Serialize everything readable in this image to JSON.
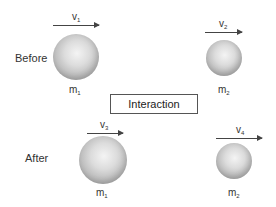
{
  "diagram": {
    "stages": [
      {
        "label": "Before",
        "bodies": [
          {
            "mass_label": "m",
            "mass_sub": "1",
            "velocity_label": "v",
            "velocity_sub": "1"
          },
          {
            "mass_label": "m",
            "mass_sub": "2",
            "velocity_label": "v",
            "velocity_sub": "2"
          }
        ]
      },
      {
        "label": "After",
        "bodies": [
          {
            "mass_label": "m",
            "mass_sub": "1",
            "velocity_label": "v",
            "velocity_sub": "3"
          },
          {
            "mass_label": "m",
            "mass_sub": "2",
            "velocity_label": "v",
            "velocity_sub": "4"
          }
        ]
      }
    ],
    "center_box": {
      "label": "Interaction"
    },
    "colors": {
      "sphere_light": "#f4f4f4",
      "sphere_dark": "#8c8c8c",
      "stroke": "#444444",
      "background": "#ffffff"
    }
  }
}
